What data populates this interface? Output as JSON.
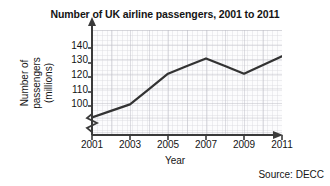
{
  "figure": {
    "title": "Number of UK airline passengers, 2001 to 2011",
    "source_note": "Source: DECC"
  },
  "axes": {
    "x_title": "Year",
    "y_title_lines": [
      "Number of",
      "passengers",
      "(millions)"
    ],
    "x_tick_labels": [
      "2001",
      "2003",
      "2005",
      "2007",
      "2009",
      "2011"
    ],
    "y_tick_labels": [
      "100",
      "110",
      "120",
      "130",
      "140"
    ]
  },
  "chart_data": {
    "type": "line",
    "title": "Number of UK airline passengers, 2001 to 2011",
    "subtitle": "",
    "xlabel": "Year",
    "ylabel": "Number of passengers (millions)",
    "x": [
      2001,
      2002,
      2003,
      2004,
      2005,
      2006,
      2007,
      2008,
      2009,
      2010,
      2011
    ],
    "series": [
      {
        "name": "UK airline passengers",
        "values": [
          104,
          107,
          110,
          117,
          124,
          127.5,
          131,
          127.5,
          124,
          128,
          132
        ],
        "color": "#333333"
      }
    ],
    "xlim": [
      2001,
      2011
    ],
    "ylim": [
      96,
      144
    ],
    "y_ticks": [
      100,
      110,
      120,
      130,
      140
    ],
    "x_ticks": [
      2001,
      2003,
      2005,
      2007,
      2009,
      2011
    ],
    "grid": true,
    "grid_minor": true,
    "legend": "none",
    "y_axis_break": true,
    "annotations": [
      "Source: DECC"
    ],
    "note": "y axis is broken below 100; line vertices read at odd years: 2001=104, 2003=110, 2005=124, 2007=131, 2009=124, 2011=132"
  },
  "style": {
    "grid_minor_color": "#d8d8dd",
    "grid_major_color": "#b9b9c0",
    "axis_color": "#3a3a3a",
    "plot_background": "#fcfcfd"
  }
}
